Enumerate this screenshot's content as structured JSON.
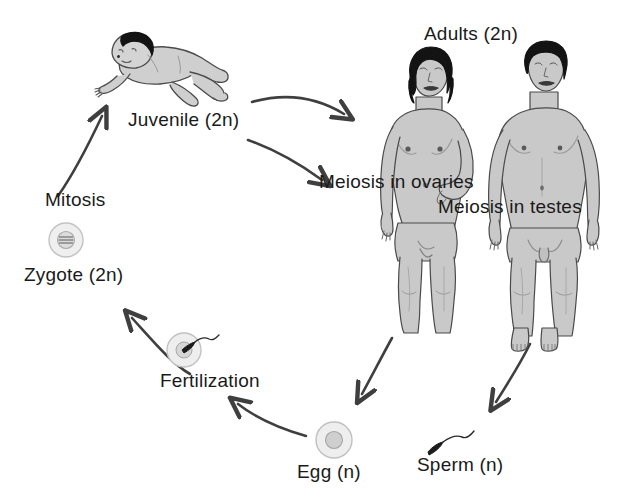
{
  "diagram": {
    "background_color": "#ffffff",
    "ink_color": "#3a3a3a",
    "text_color": "#1a1a1a",
    "skin_fill": "#c9c9c9",
    "hair_fill": "#111111",
    "cell_fill": "#e2e2e2"
  },
  "labels": {
    "juvenile": "Juvenile (2n)",
    "mitosis": "Mitosis",
    "zygote": "Zygote (2n)",
    "fertilization": "Fertilization",
    "egg": "Egg (n)",
    "sperm": "Sperm (n)",
    "adults": "Adults (2n)",
    "meiosis_ovaries": "Meiosis in ovaries",
    "meiosis_testes": "Meiosis in testes"
  },
  "figures": {
    "baby": "crawling-infant-illustration",
    "woman": "adult-female-figure-illustration",
    "man": "adult-male-figure-illustration",
    "zygote_cell": "zygote-cell-with-chromosomes",
    "fertilization_cell": "egg-cell-with-sperm-entering",
    "egg_cell": "egg-cell",
    "sperm_cell": "sperm-cell"
  },
  "arrows": [
    {
      "name": "zygote-to-juvenile",
      "from": "Zygote (2n)",
      "to": "Juvenile (2n)",
      "label": "Mitosis"
    },
    {
      "name": "juvenile-to-female-adult",
      "from": "Juvenile (2n)",
      "to": "Adults (2n)",
      "label": ""
    },
    {
      "name": "juvenile-to-male-adult",
      "from": "Juvenile (2n)",
      "to": "Adults (2n)",
      "label": ""
    },
    {
      "name": "female-to-egg",
      "from": "Adults (2n)",
      "to": "Egg (n)",
      "label": "Meiosis in ovaries"
    },
    {
      "name": "male-to-sperm",
      "from": "Adults (2n)",
      "to": "Sperm (n)",
      "label": "Meiosis in testes"
    },
    {
      "name": "egg-to-fertilization",
      "from": "Egg (n)",
      "to": "Fertilization",
      "label": ""
    },
    {
      "name": "fertilization-to-zygote",
      "from": "Fertilization",
      "to": "Zygote (2n)",
      "label": ""
    }
  ]
}
